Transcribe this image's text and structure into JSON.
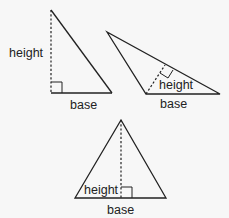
{
  "diagram": {
    "triangles": [
      {
        "name": "right-triangle",
        "height_label": "height",
        "base_label": "base"
      },
      {
        "name": "obtuse-triangle",
        "height_label": "height",
        "base_label": "base"
      },
      {
        "name": "acute-triangle",
        "height_label": "height",
        "base_label": "base"
      }
    ],
    "colors": {
      "line": "#222222",
      "background": "#f7f7f7"
    }
  }
}
